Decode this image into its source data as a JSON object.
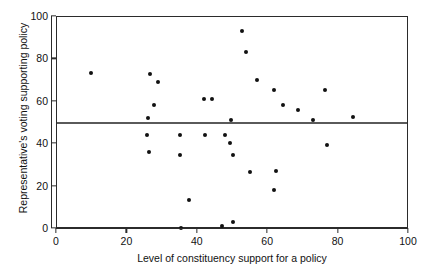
{
  "chart_data": {
    "type": "scatter",
    "title": "",
    "xlabel": "Level of constituency support for a policy",
    "ylabel": "Representative's voting supporting policy",
    "xlim": [
      0,
      100
    ],
    "ylim": [
      0,
      100
    ],
    "xticks": [
      0,
      20,
      40,
      60,
      80,
      100
    ],
    "yticks": [
      0,
      20,
      40,
      60,
      80,
      100
    ],
    "grid": false,
    "legend": null,
    "marker_color": "#111111",
    "frame_color": "#2b2b2b",
    "reference_lines": [
      {
        "orientation": "horizontal",
        "value": 50,
        "color": "#5a5a5a"
      }
    ],
    "points": [
      {
        "x": 9.7,
        "y": 73.6
      },
      {
        "x": 26.4,
        "y": 73.1
      },
      {
        "x": 28.7,
        "y": 69.3
      },
      {
        "x": 27.6,
        "y": 58.5
      },
      {
        "x": 25.6,
        "y": 44.3
      },
      {
        "x": 25.9,
        "y": 52.4
      },
      {
        "x": 26.1,
        "y": 36.3
      },
      {
        "x": 34.9,
        "y": 44.3
      },
      {
        "x": 35.0,
        "y": 34.9
      },
      {
        "x": 35.2,
        "y": 0.5
      },
      {
        "x": 37.5,
        "y": 13.7
      },
      {
        "x": 41.8,
        "y": 61.3
      },
      {
        "x": 44.0,
        "y": 61.3
      },
      {
        "x": 42.0,
        "y": 44.3
      },
      {
        "x": 46.9,
        "y": 1.4
      },
      {
        "x": 50.0,
        "y": 3.3
      },
      {
        "x": 52.6,
        "y": 93.4
      },
      {
        "x": 53.7,
        "y": 83.5
      },
      {
        "x": 49.4,
        "y": 51.4
      },
      {
        "x": 47.7,
        "y": 44.3
      },
      {
        "x": 49.2,
        "y": 40.6
      },
      {
        "x": 56.8,
        "y": 70.3
      },
      {
        "x": 50.0,
        "y": 34.9
      },
      {
        "x": 54.8,
        "y": 26.9
      },
      {
        "x": 61.6,
        "y": 65.6
      },
      {
        "x": 64.2,
        "y": 58.5
      },
      {
        "x": 68.5,
        "y": 56.1
      },
      {
        "x": 61.7,
        "y": 18.4
      },
      {
        "x": 62.2,
        "y": 27.4
      },
      {
        "x": 72.7,
        "y": 51.4
      },
      {
        "x": 76.1,
        "y": 65.6
      },
      {
        "x": 76.7,
        "y": 39.6
      },
      {
        "x": 84.1,
        "y": 52.8
      }
    ]
  }
}
